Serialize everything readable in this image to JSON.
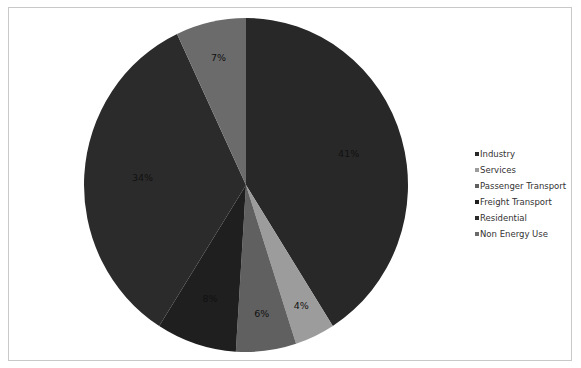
{
  "chart_data": {
    "type": "pie",
    "title": "",
    "categories": [
      "Industry",
      "Services",
      "Passenger Transport",
      "Freight Transport",
      "Residential",
      "Non Energy Use"
    ],
    "values": [
      41,
      4,
      6,
      8,
      34,
      7
    ],
    "labels": [
      "41%",
      "4%",
      "6%",
      "8%",
      "34%",
      "7%"
    ],
    "colors": [
      "#282828",
      "#9c9c9c",
      "#606060",
      "#1f1f1f",
      "#2b2b2b",
      "#6b6b6b"
    ],
    "start_angle": "12 o'clock, clockwise",
    "legend_position": "right"
  },
  "legend": {
    "items": [
      {
        "label": "Industry",
        "color": "#282828"
      },
      {
        "label": "Services",
        "color": "#9c9c9c"
      },
      {
        "label": "Passenger Transport",
        "color": "#606060"
      },
      {
        "label": "Freight Transport",
        "color": "#1f1f1f"
      },
      {
        "label": "Residential",
        "color": "#2b2b2b"
      },
      {
        "label": "Non Energy Use",
        "color": "#6b6b6b"
      }
    ]
  }
}
